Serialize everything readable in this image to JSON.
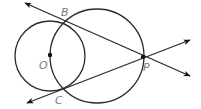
{
  "diagram": {
    "colors": {
      "stroke": "#2a2a2a",
      "label": "#7a7a7a",
      "point": "#111111",
      "background": "#ffffff"
    },
    "circles": [
      {
        "id": "circle-O",
        "cx": 50,
        "cy": 56,
        "r": 35
      },
      {
        "id": "circle-OP",
        "cx": 97,
        "cy": 56,
        "r": 47
      }
    ],
    "points": {
      "O": {
        "label": "O",
        "x": 50,
        "y": 55,
        "label_x": 39,
        "label_y": 69
      },
      "B": {
        "label": "B",
        "x": 65,
        "y": 22,
        "label_x": 61,
        "label_y": 16
      },
      "C": {
        "label": "C",
        "x": 60,
        "y": 89,
        "label_x": 55,
        "label_y": 104
      },
      "P": {
        "label": "P",
        "x": 143,
        "y": 57,
        "label_x": 143,
        "label_y": 71
      }
    },
    "lines": [
      {
        "id": "line-PB",
        "from": [
          190,
          76
        ],
        "to": [
          25,
          3
        ],
        "through": [
          "P",
          "B"
        ],
        "arrows": "both"
      },
      {
        "id": "line-PC",
        "from": [
          190,
          40
        ],
        "to": [
          27,
          103
        ],
        "through": [
          "P",
          "C"
        ],
        "arrows": "both"
      }
    ]
  }
}
